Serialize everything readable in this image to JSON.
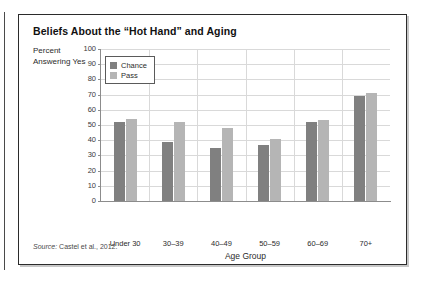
{
  "chart_data": {
    "type": "bar",
    "title": "Beliefs About the “Hot Hand” and Aging",
    "xlabel": "Age Group",
    "ylabel": "Percent Answering Yes",
    "categories": [
      "Under 30",
      "30–39",
      "40–49",
      "50–59",
      "60–69",
      "70+"
    ],
    "series": [
      {
        "name": "Chance",
        "color": "#808080",
        "values": [
          52,
          39,
          35,
          37,
          52,
          69
        ]
      },
      {
        "name": "Pass",
        "color": "#b5b5b5",
        "values": [
          54,
          52,
          48,
          41,
          53,
          71
        ]
      }
    ],
    "ylim": [
      0,
      100
    ],
    "yticks": [
      0,
      10,
      20,
      30,
      40,
      50,
      60,
      70,
      80,
      90,
      100
    ],
    "ytick_labels": [
      "0",
      "10",
      "20",
      "30",
      "40",
      "50",
      "60",
      "70",
      "80",
      "90",
      "100"
    ],
    "grid": "horizontal-and-category-separators",
    "legend_position": "upper-left-inside"
  },
  "source": {
    "prefix": "Source:",
    "text": "Castel et al., 2012."
  }
}
